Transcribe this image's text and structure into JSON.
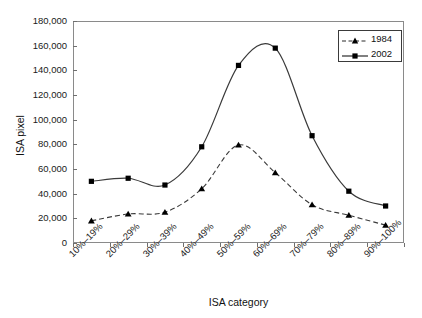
{
  "chart_data": {
    "type": "line",
    "title": "",
    "xlabel": "ISA category",
    "ylabel": "ISA pixel",
    "categories": [
      "10%–19%",
      "20%–29%",
      "30%–39%",
      "40%–49%",
      "50%–59%",
      "60%–69%",
      "70%–79%",
      "80%–89%",
      "90%–100%"
    ],
    "series": [
      {
        "name": "1984",
        "values": [
          18000,
          23500,
          25000,
          44000,
          79500,
          57000,
          31000,
          22500,
          14500
        ],
        "marker": "triangle",
        "line": "dashed"
      },
      {
        "name": "2002",
        "values": [
          50000,
          52500,
          47000,
          78000,
          144000,
          158000,
          87000,
          42000,
          30000
        ],
        "marker": "square",
        "line": "solid"
      }
    ],
    "ylim": [
      0,
      180000
    ],
    "yticks": [
      "0",
      "20,000",
      "40,000",
      "60,000",
      "80,000",
      "100,000",
      "120,000",
      "140,000",
      "160,000",
      "180,000"
    ],
    "ytick_values": [
      0,
      20000,
      40000,
      60000,
      80000,
      100000,
      120000,
      140000,
      160000,
      180000
    ],
    "grid": false,
    "legend_position": "top-right",
    "legend_entries": [
      "1984",
      "2002"
    ],
    "line_color": "#3a3a3a",
    "marker_color": "#000000"
  }
}
